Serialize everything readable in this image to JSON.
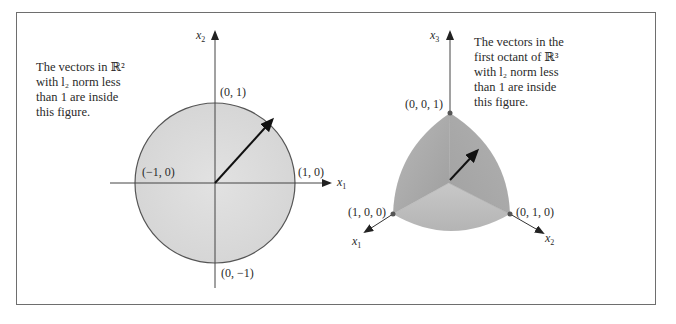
{
  "left_figure": {
    "caption_lines": [
      "The vectors in ℝ²",
      "with l₂ norm less",
      "than 1 are inside",
      "this figure."
    ],
    "axis_x_label": "x",
    "axis_x_sub": "1",
    "axis_y_label": "x",
    "axis_y_sub": "2",
    "points": {
      "top": "(0, 1)",
      "bottom": "(0, −1)",
      "left": "(−1, 0)",
      "right": "(1, 0)"
    },
    "shape": "unit disk (circle)",
    "fill_color": "#dcdcdc",
    "outline_color": "#555555"
  },
  "right_figure": {
    "caption_lines": [
      "The vectors in the",
      "first octant of ℝ³",
      "with l₂ norm less",
      "than 1 are inside",
      "this figure."
    ],
    "axis_x1_label": "x",
    "axis_x1_sub": "1",
    "axis_x2_label": "x",
    "axis_x2_sub": "2",
    "axis_x3_label": "x",
    "axis_x3_sub": "3",
    "points": {
      "top": "(0, 0, 1)",
      "left": "(1, 0, 0)",
      "right": "(0, 1, 0)"
    },
    "shape": "unit sphere octant",
    "face_colors": [
      "#a9a9a9",
      "#b5b5b5",
      "#c4c4c4"
    ]
  }
}
